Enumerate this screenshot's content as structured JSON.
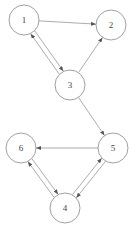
{
  "diagram": {
    "type": "directed-graph",
    "colors": {
      "stroke": "#888888",
      "label": "#444444",
      "background": "#ffffff"
    },
    "nodes": [
      {
        "id": "1",
        "label": "1",
        "x": 24,
        "y": 20,
        "r": 15
      },
      {
        "id": "2",
        "label": "2",
        "x": 111,
        "y": 25,
        "r": 15
      },
      {
        "id": "3",
        "label": "3",
        "x": 70,
        "y": 85,
        "r": 15
      },
      {
        "id": "5",
        "label": "5",
        "x": 113,
        "y": 148,
        "r": 15
      },
      {
        "id": "6",
        "label": "6",
        "x": 21,
        "y": 148,
        "r": 15
      },
      {
        "id": "4",
        "label": "4",
        "x": 65,
        "y": 208,
        "r": 15
      }
    ],
    "edges": [
      {
        "from": "1",
        "to": "2"
      },
      {
        "from": "1",
        "to": "3",
        "offset": -2.5
      },
      {
        "from": "3",
        "to": "1",
        "offset": -2.5
      },
      {
        "from": "3",
        "to": "2"
      },
      {
        "from": "3",
        "to": "5"
      },
      {
        "from": "5",
        "to": "6"
      },
      {
        "from": "5",
        "to": "4",
        "offset": -2.5
      },
      {
        "from": "4",
        "to": "5",
        "offset": -2.5
      },
      {
        "from": "6",
        "to": "4",
        "offset": -2.5
      },
      {
        "from": "4",
        "to": "6",
        "offset": -2.5
      }
    ]
  }
}
